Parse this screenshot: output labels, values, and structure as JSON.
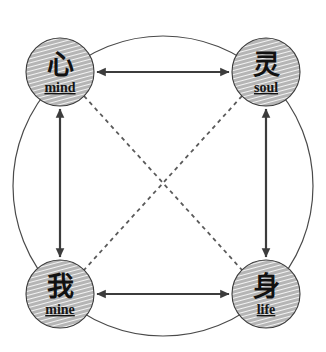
{
  "diagram": {
    "colors": {
      "outline": "#4a4a4a",
      "node_fill": "#b8b8b8",
      "node_hatch": "#ffffff",
      "node_stroke": "#3a3a3a",
      "arrow": "#3c3c3c",
      "dashed": "#5a5a5a",
      "text": "#111111",
      "background": "#ffffff"
    },
    "outer_circle": {
      "cx": 163,
      "cy": 186,
      "r": 150,
      "stroke_width": 1.2
    },
    "nodes": [
      {
        "id": "mind",
        "cn": "心",
        "en": "mind",
        "cx": 60,
        "cy": 72,
        "r": 34,
        "position": "top-left"
      },
      {
        "id": "soul",
        "cn": "灵",
        "en": "soul",
        "cx": 266,
        "cy": 72,
        "r": 34,
        "position": "top-right"
      },
      {
        "id": "mine",
        "cn": "我",
        "en": "mine",
        "cx": 60,
        "cy": 294,
        "r": 34,
        "position": "bottom-left"
      },
      {
        "id": "life",
        "cn": "身",
        "en": "life",
        "cx": 266,
        "cy": 294,
        "r": 34,
        "position": "bottom-right"
      }
    ],
    "edges": [
      {
        "id": "mind-soul",
        "from": "mind",
        "to": "soul",
        "style": "solid",
        "arrows": "both",
        "orientation": "horizontal-top"
      },
      {
        "id": "mine-life",
        "from": "mine",
        "to": "life",
        "style": "solid",
        "arrows": "both",
        "orientation": "horizontal-bottom"
      },
      {
        "id": "mind-mine",
        "from": "mind",
        "to": "mine",
        "style": "solid",
        "arrows": "both",
        "orientation": "vertical-left"
      },
      {
        "id": "soul-life",
        "from": "soul",
        "to": "life",
        "style": "solid",
        "arrows": "both",
        "orientation": "vertical-right"
      },
      {
        "id": "mind-life",
        "from": "mind",
        "to": "life",
        "style": "dashed",
        "arrows": "none",
        "orientation": "diagonal-down-right"
      },
      {
        "id": "soul-mine",
        "from": "soul",
        "to": "mine",
        "style": "dashed",
        "arrows": "none",
        "orientation": "diagonal-down-left"
      }
    ]
  }
}
